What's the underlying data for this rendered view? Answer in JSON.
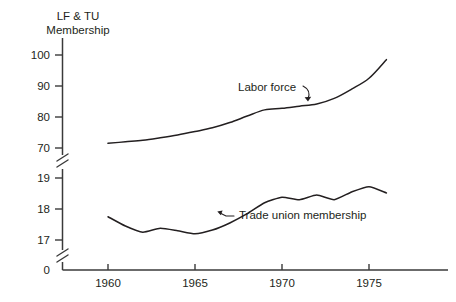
{
  "chart_data": {
    "type": "line",
    "title": "LF & TU Membership",
    "title_lines": [
      "LF & TU",
      "Membership"
    ],
    "xlabel": "",
    "ylabel": "LF & TU Membership",
    "grid": false,
    "legend_position": "inline-annotations",
    "broken_axis": true,
    "axis_notes": "Y axis is broken: lower segment shows 0 then 17-19 (Trade union membership, millions); upper segment shows 70-100 (Labor force, millions)",
    "x": [
      1960,
      1961,
      1962,
      1963,
      1964,
      1965,
      1966,
      1967,
      1968,
      1969,
      1970,
      1971,
      1972,
      1973,
      1974,
      1975,
      1976
    ],
    "xlim": [
      1958,
      1977
    ],
    "x_ticks": [
      1960,
      1965,
      1970,
      1975
    ],
    "x_tick_labels": [
      "1960",
      "1965",
      "1970",
      "1975"
    ],
    "y_ticks_upper": [
      70,
      80,
      90,
      100
    ],
    "y_tick_labels_upper": [
      "70",
      "80",
      "90",
      "100"
    ],
    "y_ticks_lower": [
      0,
      17,
      18,
      19
    ],
    "y_tick_labels_lower": [
      "0",
      "17",
      "18",
      "19"
    ],
    "ylim_upper": [
      70,
      100
    ],
    "ylim_lower": [
      17,
      19
    ],
    "series": [
      {
        "name": "Labor force",
        "label": "Labor force",
        "scale": "upper",
        "units": "millions",
        "values": [
          71.5,
          72.0,
          72.5,
          73.3,
          74.2,
          75.3,
          76.5,
          78.2,
          80.3,
          82.3,
          82.8,
          83.5,
          84.2,
          86.0,
          89.0,
          92.5,
          98.5
        ]
      },
      {
        "name": "Trade union membership",
        "label": "Trade union membership",
        "scale": "lower",
        "units": "millions",
        "values": [
          17.75,
          17.45,
          17.25,
          17.38,
          17.3,
          17.2,
          17.32,
          17.55,
          17.85,
          18.2,
          18.38,
          18.3,
          18.45,
          18.3,
          18.55,
          18.72,
          18.52
        ]
      }
    ],
    "annotations": [
      {
        "text": "Labor force",
        "points_to": "labor-force-line"
      },
      {
        "text": "Trade union membership",
        "points_to": "trade-union-line"
      }
    ]
  },
  "axis": {
    "title_line1": "LF & TU",
    "title_line2": "Membership",
    "y_labels": [
      "100",
      "90",
      "80",
      "70",
      "19",
      "18",
      "17",
      "0"
    ],
    "x_labels": [
      "1960",
      "1965",
      "1970",
      "1975"
    ]
  },
  "labels": {
    "labor_force": "Labor force",
    "trade_union": "Trade union membership"
  },
  "colors": {
    "background": "#ffffff",
    "ink": "#231f20",
    "axis": "#3a3a3a"
  }
}
